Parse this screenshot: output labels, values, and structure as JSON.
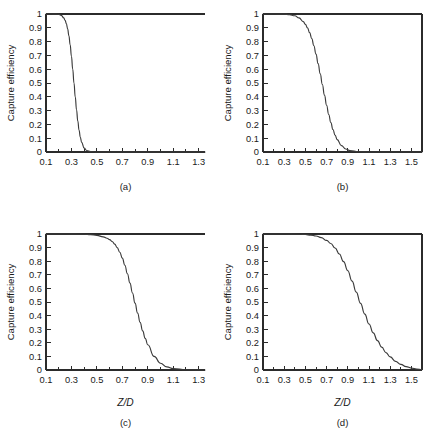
{
  "figure": {
    "background": "#ffffff",
    "ink_color": "#2b2b2b",
    "curve_color": "#3a3a3a"
  },
  "chart_data": [
    {
      "type": "line",
      "panel": "a",
      "caption": "(a)",
      "title": "",
      "xlabel": "",
      "ylabel": "Capture efficiency",
      "xlim": [
        0.1,
        1.35
      ],
      "ylim": [
        0,
        1
      ],
      "xticks": [
        0.1,
        0.3,
        0.5,
        0.7,
        0.9,
        1.1,
        1.3
      ],
      "xticklabels": [
        "0.1",
        "0.3",
        "0.5",
        "0.7",
        "0.9",
        "1.1",
        "1.3"
      ],
      "xminorticks": [
        0.2,
        0.4,
        0.6,
        0.8,
        1.0,
        1.2
      ],
      "yticks": [
        0,
        0.1,
        0.2,
        0.3,
        0.4,
        0.5,
        0.6,
        0.7,
        0.8,
        0.9,
        1
      ],
      "yticklabels": [
        "0",
        "0.1",
        "0.2",
        "0.3",
        "0.4",
        "0.5",
        "0.6",
        "0.7",
        "0.8",
        "0.9",
        "1"
      ],
      "grid": false,
      "frame": "open-right",
      "midpoint": 0.315,
      "width": 0.042,
      "x": [
        0.1,
        0.14,
        0.18,
        0.2,
        0.22,
        0.24,
        0.25,
        0.26,
        0.27,
        0.28,
        0.29,
        0.3,
        0.31,
        0.32,
        0.33,
        0.34,
        0.35,
        0.36,
        0.37,
        0.38,
        0.4,
        0.42,
        0.45,
        0.5,
        0.6,
        0.8,
        1.0,
        1.2,
        1.35
      ],
      "y": [
        1.0,
        1.0,
        0.999,
        0.997,
        0.99,
        0.972,
        0.955,
        0.93,
        0.893,
        0.842,
        0.776,
        0.694,
        0.601,
        0.5,
        0.399,
        0.306,
        0.224,
        0.158,
        0.107,
        0.07,
        0.028,
        0.011,
        0.003,
        0.0,
        0.0,
        0.0,
        0.0,
        0.0,
        0.0
      ]
    },
    {
      "type": "line",
      "panel": "b",
      "caption": "(b)",
      "title": "",
      "xlabel": "",
      "ylabel": "Capture efficiency",
      "xlim": [
        0.1,
        1.6
      ],
      "ylim": [
        0,
        1
      ],
      "xticks": [
        0.1,
        0.3,
        0.5,
        0.7,
        0.9,
        1.1,
        1.3,
        1.5
      ],
      "xticklabels": [
        "0.1",
        "0.3",
        "0.5",
        "0.7",
        "0.9",
        "1.1",
        "1.3",
        "1.5"
      ],
      "xminorticks": [
        0.2,
        0.4,
        0.6,
        0.8,
        1.0,
        1.2,
        1.4
      ],
      "yticks": [
        0,
        0.1,
        0.2,
        0.3,
        0.4,
        0.5,
        0.6,
        0.7,
        0.8,
        0.9,
        1
      ],
      "yticklabels": [
        "0",
        "0.1",
        "0.2",
        "0.3",
        "0.4",
        "0.5",
        "0.6",
        "0.7",
        "0.8",
        "0.9",
        "1"
      ],
      "grid": false,
      "frame": "box",
      "midpoint": 0.625,
      "width": 0.083,
      "x": [
        0.1,
        0.2,
        0.3,
        0.35,
        0.4,
        0.44,
        0.48,
        0.5,
        0.52,
        0.54,
        0.56,
        0.58,
        0.6,
        0.62,
        0.64,
        0.66,
        0.68,
        0.7,
        0.72,
        0.74,
        0.76,
        0.78,
        0.8,
        0.84,
        0.88,
        0.92,
        1.0,
        1.1,
        1.3,
        1.5,
        1.6
      ],
      "y": [
        1.0,
        1.0,
        0.999,
        0.996,
        0.987,
        0.972,
        0.945,
        0.925,
        0.899,
        0.865,
        0.822,
        0.77,
        0.709,
        0.64,
        0.566,
        0.489,
        0.412,
        0.339,
        0.272,
        0.213,
        0.163,
        0.122,
        0.09,
        0.046,
        0.022,
        0.01,
        0.002,
        0.0,
        0.0,
        0.0,
        0.0
      ]
    },
    {
      "type": "line",
      "panel": "c",
      "caption": "(c)",
      "title": "",
      "xlabel": "Z/D",
      "ylabel": "Capture efficiency",
      "xlim": [
        0.1,
        1.35
      ],
      "ylim": [
        0,
        1
      ],
      "xticks": [
        0.1,
        0.3,
        0.5,
        0.7,
        0.9,
        1.1,
        1.3
      ],
      "xticklabels": [
        "0.1",
        "0.3",
        "0.5",
        "0.7",
        "0.9",
        "1.1",
        "1.3"
      ],
      "xminorticks": [
        0.2,
        0.4,
        0.6,
        0.8,
        1.0,
        1.2
      ],
      "yticks": [
        0,
        0.1,
        0.2,
        0.3,
        0.4,
        0.5,
        0.6,
        0.7,
        0.8,
        0.9,
        1
      ],
      "yticklabels": [
        "0",
        "0.1",
        "0.2",
        "0.3",
        "0.4",
        "0.5",
        "0.6",
        "0.7",
        "0.8",
        "0.9",
        "1"
      ],
      "grid": false,
      "frame": "open-right",
      "midpoint": 0.725,
      "width": 0.085,
      "x": [
        0.1,
        0.25,
        0.4,
        0.45,
        0.5,
        0.55,
        0.58,
        0.6,
        0.62,
        0.64,
        0.66,
        0.68,
        0.7,
        0.72,
        0.74,
        0.76,
        0.78,
        0.8,
        0.82,
        0.84,
        0.86,
        0.88,
        0.9,
        0.95,
        1.0,
        1.05,
        1.1,
        1.2,
        1.35
      ],
      "y": [
        1.0,
        1.0,
        0.998,
        0.995,
        0.99,
        0.979,
        0.969,
        0.959,
        0.945,
        0.926,
        0.9,
        0.866,
        0.823,
        0.77,
        0.708,
        0.639,
        0.566,
        0.492,
        0.419,
        0.35,
        0.288,
        0.233,
        0.186,
        0.1,
        0.05,
        0.023,
        0.01,
        0.002,
        0.0
      ]
    },
    {
      "type": "line",
      "panel": "d",
      "caption": "(d)",
      "title": "",
      "xlabel": "Z/D",
      "ylabel": "Capture efficiency",
      "xlim": [
        0.1,
        1.6
      ],
      "ylim": [
        0,
        1
      ],
      "xticks": [
        0.1,
        0.3,
        0.5,
        0.7,
        0.9,
        1.1,
        1.3,
        1.5
      ],
      "xticklabels": [
        "0.1",
        "0.3",
        "0.5",
        "0.7",
        "0.9",
        "1.1",
        "1.3",
        "1.5"
      ],
      "xminorticks": [
        0.2,
        0.4,
        0.6,
        0.8,
        1.0,
        1.2,
        1.4
      ],
      "yticks": [
        0,
        0.1,
        0.2,
        0.3,
        0.4,
        0.5,
        0.6,
        0.7,
        0.8,
        0.9,
        1
      ],
      "yticklabels": [
        "0",
        "0.1",
        "0.2",
        "0.3",
        "0.4",
        "0.5",
        "0.6",
        "0.7",
        "0.8",
        "0.9",
        "1"
      ],
      "grid": false,
      "frame": "box",
      "midpoint": 0.905,
      "width": 0.125,
      "x": [
        0.1,
        0.3,
        0.45,
        0.5,
        0.55,
        0.6,
        0.65,
        0.7,
        0.74,
        0.78,
        0.82,
        0.86,
        0.9,
        0.94,
        0.98,
        1.02,
        1.06,
        1.1,
        1.14,
        1.18,
        1.22,
        1.26,
        1.3,
        1.35,
        1.4,
        1.45,
        1.5,
        1.55,
        1.6
      ],
      "y": [
        1.0,
        1.0,
        0.998,
        0.996,
        0.992,
        0.985,
        0.973,
        0.953,
        0.93,
        0.897,
        0.853,
        0.797,
        0.73,
        0.654,
        0.573,
        0.49,
        0.411,
        0.338,
        0.273,
        0.216,
        0.168,
        0.128,
        0.096,
        0.064,
        0.041,
        0.025,
        0.014,
        0.007,
        0.003
      ]
    }
  ]
}
